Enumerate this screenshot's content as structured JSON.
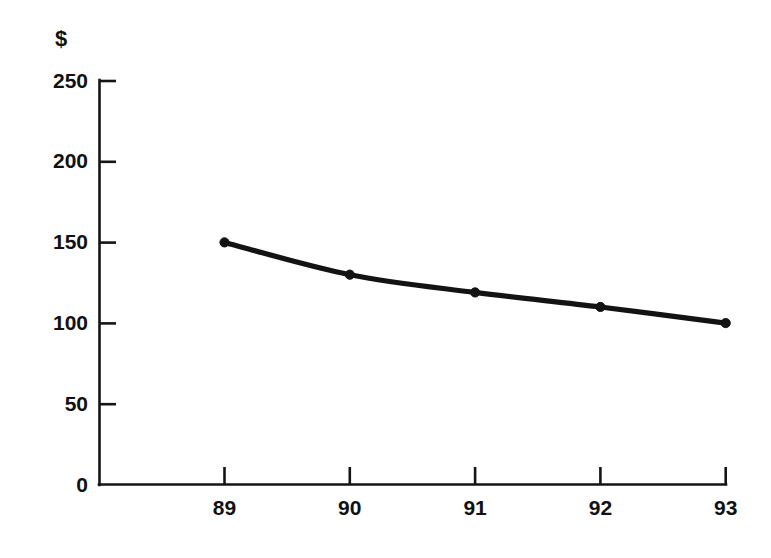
{
  "chart_data": {
    "type": "line",
    "title": "",
    "subtitle": "",
    "xlabel": "",
    "ylabel": "$",
    "ylim": [
      0,
      250
    ],
    "xlim": [
      89,
      93
    ],
    "grid": false,
    "legend": null,
    "x": [
      "89",
      "90",
      "91",
      "92",
      "93"
    ],
    "categories": [
      "89",
      "90",
      "91",
      "92",
      "93"
    ],
    "yticks": [
      "250",
      "200",
      "150",
      "100",
      "50",
      "0"
    ],
    "ytick_values": [
      250,
      200,
      150,
      100,
      50,
      0
    ],
    "xticks": [
      "89",
      "90",
      "91",
      "92",
      "93"
    ],
    "series": [
      {
        "name": "",
        "values": [
          150,
          130,
          119,
          110,
          100
        ],
        "color": "#131313",
        "marker": "circle"
      }
    ],
    "annotations": [],
    "axis_color": "#151515",
    "background": "#ffffff"
  }
}
